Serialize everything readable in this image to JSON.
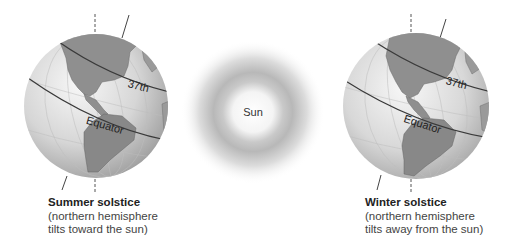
{
  "sun": {
    "label": "Sun"
  },
  "globes": [
    {
      "id": "summer",
      "latitude_label": "37th",
      "equator_label": "Equator",
      "caption_title": "Summer solstice",
      "caption_line1": "(northern hemisphere",
      "caption_line2": "tilts toward the sun)"
    },
    {
      "id": "winter",
      "latitude_label": "37th",
      "equator_label": "Equator",
      "caption_title": "Winter solstice",
      "caption_line1": "(northern hemisphere",
      "caption_line2": "tilts away from the sun)"
    }
  ],
  "colors": {
    "ocean_light": "#f2f2f2",
    "ocean_dark": "#a8a8a8",
    "land": "#8c8c8c",
    "line": "#444444"
  }
}
